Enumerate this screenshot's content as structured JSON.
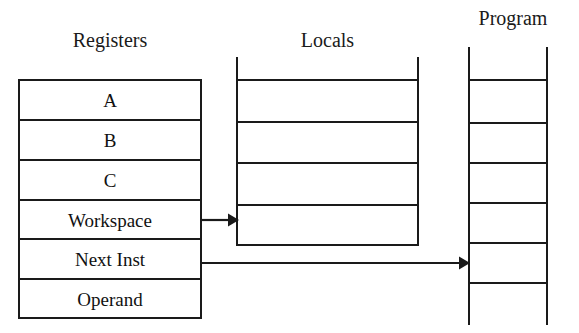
{
  "diagram": {
    "stroke_color": "#1a1a1a",
    "background_color": "#ffffff",
    "columns": [
      {
        "id": "registers",
        "heading": "Registers",
        "kind": "closed-box",
        "rows": [
          "A",
          "B",
          "C",
          "Workspace",
          "Next Inst",
          "Operand"
        ]
      },
      {
        "id": "locals",
        "heading": "Locals",
        "kind": "open-rail-ladder",
        "row_count": 4
      },
      {
        "id": "program",
        "heading": "Program",
        "kind": "open-rail-ladder",
        "row_count": 5
      }
    ],
    "arrows": [
      {
        "id": "workspace-to-locals",
        "from": "Workspace",
        "to": "Locals"
      },
      {
        "id": "next-inst-to-program",
        "from": "Next Inst",
        "to": "Program"
      }
    ]
  }
}
